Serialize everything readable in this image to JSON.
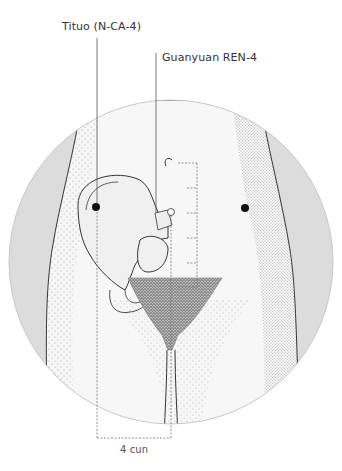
{
  "labels": {
    "tituo": "Tituo (N-CA-4)",
    "guanyuan": "Guanyuan REN-4",
    "measurement": "4 cun"
  },
  "points": [
    {
      "name": "Tituo (N-CA-4)",
      "side": "left",
      "marker": "filled"
    },
    {
      "name": "Tituo (N-CA-4)",
      "side": "right",
      "marker": "filled"
    },
    {
      "name": "Guanyuan REN-4",
      "side": "midline",
      "marker": "open"
    }
  ],
  "ruler": {
    "divisions": 5
  },
  "colors": {
    "outer_band": "#dcdcdc",
    "skin": "#f4f4f4",
    "line": "#333333",
    "leader_line": "#555555",
    "point": "#111111"
  }
}
